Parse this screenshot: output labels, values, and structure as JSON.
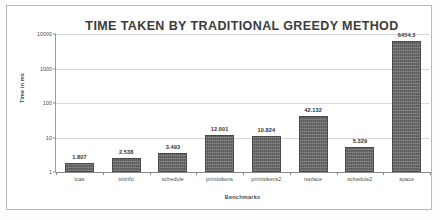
{
  "chart_data": {
    "type": "bar",
    "title": "TIME TAKEN BY TRADITIONAL GREEDY METHOD",
    "xlabel": "Benchmarks",
    "ylabel": "Time in ms",
    "yscale": "log",
    "ylim": [
      1,
      10000
    ],
    "ytick_labels": [
      "1",
      "10",
      "100",
      "1000",
      "10000"
    ],
    "ytick_values": [
      1,
      10,
      100,
      1000,
      10000
    ],
    "grid": true,
    "legend": false,
    "bar_color": "#5c5c5c",
    "categories": [
      "tcas",
      "totinfo",
      "schedule",
      "printtokens",
      "printtokens2",
      "replace",
      "schedule2",
      "space"
    ],
    "values": [
      1.807,
      2.538,
      3.493,
      12.001,
      10.824,
      42.132,
      5.329,
      6454.3
    ],
    "value_labels": [
      "1.807",
      "2.538",
      "3.493",
      "12.001",
      "10.824",
      "42.132",
      "5.329",
      "6454.3"
    ]
  }
}
